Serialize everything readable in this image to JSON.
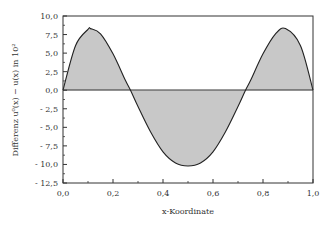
{
  "chart_data": {
    "type": "area",
    "title": "",
    "xlabel": "x-Koordinate",
    "ylabel": "Differenz u⁰(x) − u(x) in 10²",
    "xlim": [
      0.0,
      1.0
    ],
    "ylim": [
      -12.5,
      10.0
    ],
    "grid": false,
    "legend": null,
    "x_ticks": [
      "0,0",
      "0,2",
      "0,4",
      "0,6",
      "0,8",
      "1,0"
    ],
    "y_ticks": [
      "10,0",
      "7,5",
      "5,0",
      "2,5",
      "0,0",
      "- 2,5",
      "- 5,0",
      "- 7,5",
      "- 10,0",
      "- 12,5"
    ],
    "fill_color": "#c8c8c8",
    "line_color": "#222222",
    "series": [
      {
        "name": "Differenz",
        "x": [
          0.0,
          0.05,
          0.1,
          0.11,
          0.15,
          0.2,
          0.25,
          0.27,
          0.3,
          0.35,
          0.4,
          0.45,
          0.5,
          0.55,
          0.6,
          0.65,
          0.7,
          0.73,
          0.75,
          0.8,
          0.85,
          0.89,
          0.95,
          1.0
        ],
        "y": [
          0.0,
          6.0,
          8.2,
          8.3,
          7.6,
          4.9,
          1.3,
          0.0,
          -2.2,
          -5.6,
          -8.3,
          -9.8,
          -10.2,
          -9.8,
          -8.3,
          -5.6,
          -2.2,
          0.0,
          1.3,
          4.9,
          7.6,
          8.3,
          6.0,
          0.0
        ]
      }
    ]
  }
}
